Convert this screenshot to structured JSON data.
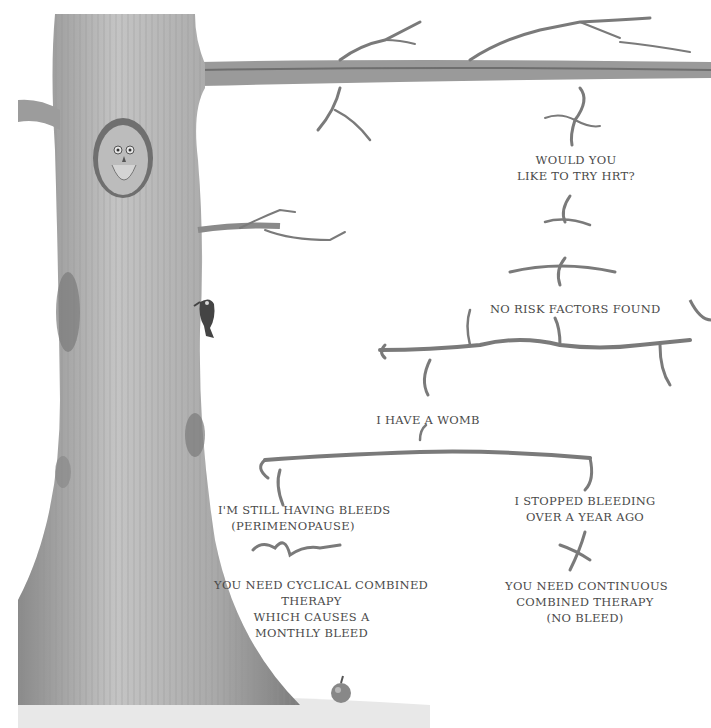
{
  "diagram": {
    "type": "decision-tree-illustration",
    "nodes": [
      {
        "id": "hrt",
        "lines": [
          "WOULD YOU",
          "LIKE TO TRY HRT?"
        ]
      },
      {
        "id": "no_risk",
        "lines": [
          "NO RISK FACTORS FOUND"
        ]
      },
      {
        "id": "womb",
        "lines": [
          "I HAVE A WOMB"
        ]
      },
      {
        "id": "still_bleeding",
        "lines": [
          "I'M STILL HAVING BLEEDS",
          "(PERIMENOPAUSE)"
        ]
      },
      {
        "id": "cyclical",
        "lines": [
          "YOU NEED CYCLICAL COMBINED",
          "THERAPY",
          "WHICH CAUSES A",
          "MONTHLY BLEED"
        ]
      },
      {
        "id": "stopped_bleeding",
        "lines": [
          "I STOPPED BLEEDING",
          "OVER A YEAR AGO"
        ]
      },
      {
        "id": "continuous",
        "lines": [
          "YOU NEED CONTINUOUS",
          "COMBINED THERAPY",
          "(NO BLEED)"
        ]
      }
    ],
    "edges": [
      [
        "hrt",
        "no_risk"
      ],
      [
        "no_risk",
        "womb"
      ],
      [
        "womb",
        "still_bleeding"
      ],
      [
        "womb",
        "stopped_bleeding"
      ],
      [
        "still_bleeding",
        "cyclical"
      ],
      [
        "stopped_bleeding",
        "continuous"
      ]
    ],
    "illustration": {
      "elements": [
        "tree-trunk",
        "owl-in-hollow",
        "woodpecker",
        "apple",
        "branches"
      ],
      "colors": {
        "trunk": "#a8a8a8",
        "trunk_dark": "#6e6e6e",
        "branch": "#7a7a7a",
        "text": "#4a4a4a",
        "background": "#ffffff"
      }
    }
  }
}
